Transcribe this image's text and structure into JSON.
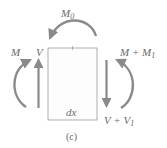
{
  "figure": {
    "caption": "(c)",
    "element_label": "dx",
    "colors": {
      "arrow": "#8a8a8a",
      "element_border": "#9a9a9a",
      "text": "#6a6a6a",
      "background": "#ffffff"
    }
  },
  "loads": {
    "top_moment": {
      "symbol": "M",
      "subscript": "0"
    },
    "left_moment": {
      "symbol": "M"
    },
    "left_shear": {
      "symbol": "V"
    },
    "right_moment": {
      "symbol": "M + M",
      "subscript": "1"
    },
    "right_shear": {
      "symbol": "V + V",
      "subscript": "1"
    }
  }
}
